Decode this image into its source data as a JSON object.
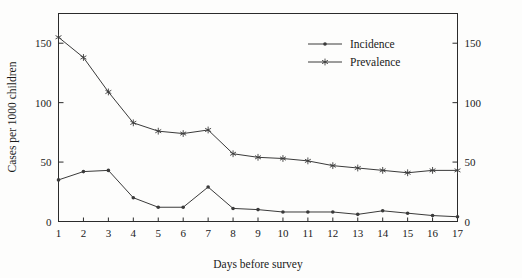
{
  "chart_data": {
    "type": "line",
    "title": "",
    "xlabel": "Days before survey",
    "ylabel": "Cases per 1000 children",
    "ylabel_right": "",
    "x": [
      1,
      2,
      3,
      4,
      5,
      6,
      7,
      8,
      9,
      10,
      11,
      12,
      13,
      14,
      15,
      16,
      17
    ],
    "xlim": [
      1,
      17
    ],
    "ylim": [
      0,
      175
    ],
    "yticks": [
      0,
      50,
      100,
      150
    ],
    "yticks_right": [
      0,
      50,
      100,
      150
    ],
    "xticks": [
      1,
      2,
      3,
      4,
      5,
      6,
      7,
      8,
      9,
      10,
      11,
      12,
      13,
      14,
      15,
      16,
      17
    ],
    "grid": false,
    "legend_position": "top-right",
    "series": [
      {
        "name": "Incidence",
        "marker": "dot",
        "values": [
          35,
          42,
          43,
          20,
          12,
          12,
          29,
          11,
          10,
          8,
          8,
          8,
          6,
          9,
          7,
          5,
          4
        ]
      },
      {
        "name": "Prevalence",
        "marker": "star",
        "values": [
          155,
          138,
          109,
          83,
          76,
          74,
          77,
          57,
          54,
          53,
          51,
          47,
          45,
          43,
          41,
          43,
          43
        ]
      }
    ]
  },
  "axes": {
    "y_title": "Cases per 1000 children",
    "x_title": "Days before survey",
    "y_tick_labels": [
      "0",
      "50",
      "100",
      "150"
    ],
    "y_right_tick_labels": [
      "0",
      "50",
      "100",
      "150"
    ],
    "x_tick_labels": [
      "1",
      "2",
      "3",
      "4",
      "5",
      "6",
      "7",
      "8",
      "9",
      "10",
      "11",
      "12",
      "13",
      "14",
      "15",
      "16",
      "17"
    ]
  },
  "legend": {
    "entries": [
      {
        "label": "Incidence",
        "marker": "dot-marker"
      },
      {
        "label": "Prevalence",
        "marker": "star-marker"
      }
    ]
  },
  "colors": {
    "line": "#3a3a3a",
    "axis": "#2b2b2b",
    "text": "#1a1a1a",
    "background": "#fdfdfc"
  }
}
